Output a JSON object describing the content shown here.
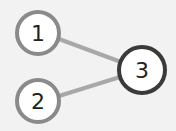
{
  "diagram": {
    "type": "graph",
    "background": "#f2f2f2",
    "nodes": [
      {
        "id": "1",
        "label": "1",
        "cx": 38,
        "cy": 33,
        "r": 21,
        "stroke": "#8a8a8a",
        "fill": "#ffffff"
      },
      {
        "id": "2",
        "label": "2",
        "cx": 38,
        "cy": 101,
        "r": 21,
        "stroke": "#8a8a8a",
        "fill": "#ffffff"
      },
      {
        "id": "3",
        "label": "3",
        "cx": 142,
        "cy": 70,
        "r": 23,
        "stroke": "#3a3a3a",
        "fill": "#ffffff"
      }
    ],
    "edges": [
      {
        "from": "1",
        "to": "3",
        "color": "#a8a8a8"
      },
      {
        "from": "2",
        "to": "3",
        "color": "#a8a8a8"
      }
    ]
  }
}
